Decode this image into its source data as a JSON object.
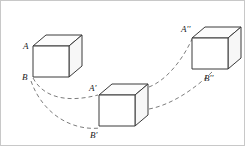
{
  "figure": {
    "width": 245,
    "height": 146,
    "background_color": "#ffffff",
    "border_color": "#c8c8c8",
    "line_color": "#3a3a3a",
    "dash_color": "#6d6d6d",
    "label_color": "#1a1a1a"
  },
  "cubes": [
    {
      "id": "cube-initial",
      "name": "cube-position-1",
      "front": "32,45 68,45 68,76 32,76",
      "top": "32,45 45,34 81,34 68,45",
      "side": "68,45 81,34 81,65 68,76",
      "labels": {
        "top_vertex": "A",
        "bottom_vertex": "B"
      }
    },
    {
      "id": "cube-middle",
      "name": "cube-position-2",
      "front": "98,94 134,94 134,125 98,125",
      "top": "98,94 111,83 147,83 134,94",
      "side": "134,94 147,83 147,114 134,125",
      "labels": {
        "top_vertex": "A'",
        "bottom_vertex": "B'"
      }
    },
    {
      "id": "cube-final",
      "name": "cube-position-3",
      "front": "191,37 227,37 227,68 191,68",
      "top": "191,37 204,26 240,26 227,37",
      "side": "227,37 240,26 240,57 227,68"
    }
  ],
  "labels": [
    {
      "id": "label-A",
      "name": "vertex-label-a",
      "base": "A",
      "prime": "",
      "x": 22,
      "y": 48
    },
    {
      "id": "label-B",
      "name": "vertex-label-b",
      "base": "B",
      "prime": "",
      "x": 21,
      "y": 79
    },
    {
      "id": "label-Ap",
      "name": "vertex-label-a-prime",
      "base": "A",
      "prime": "'",
      "x": 88,
      "y": 90
    },
    {
      "id": "label-Bp",
      "name": "vertex-label-b-prime",
      "base": "B",
      "prime": "'",
      "x": 89,
      "y": 137
    },
    {
      "id": "label-App",
      "name": "vertex-label-a-dprime",
      "base": "A",
      "prime": "''",
      "x": 180,
      "y": 31
    },
    {
      "id": "label-Bpp",
      "name": "vertex-label-b-dprime",
      "base": "B",
      "prime": "''",
      "x": 203,
      "y": 80
    }
  ],
  "trajectories": [
    {
      "id": "path-A-to-Ap",
      "name": "trajectory-upper-a",
      "from": "A",
      "to": "A'",
      "d": "M 32,77 C 44,99 70,101 97,94"
    },
    {
      "id": "path-B-to-Bp",
      "name": "trajectory-lower-b",
      "from": "B",
      "to": "B'",
      "d": "M 30,80 C 42,114 72,130 99,127"
    },
    {
      "id": "path-Ap-to-App",
      "name": "trajectory-upper-a-prime",
      "from": "A'",
      "to": "A''",
      "d": "M 148,86 C 166,79 182,58 191,38"
    },
    {
      "id": "path-Bp-to-Bpp",
      "name": "trajectory-lower-b-prime",
      "from": "B'",
      "to": "B''",
      "d": "M 148,108 C 170,104 194,88 212,70"
    }
  ]
}
